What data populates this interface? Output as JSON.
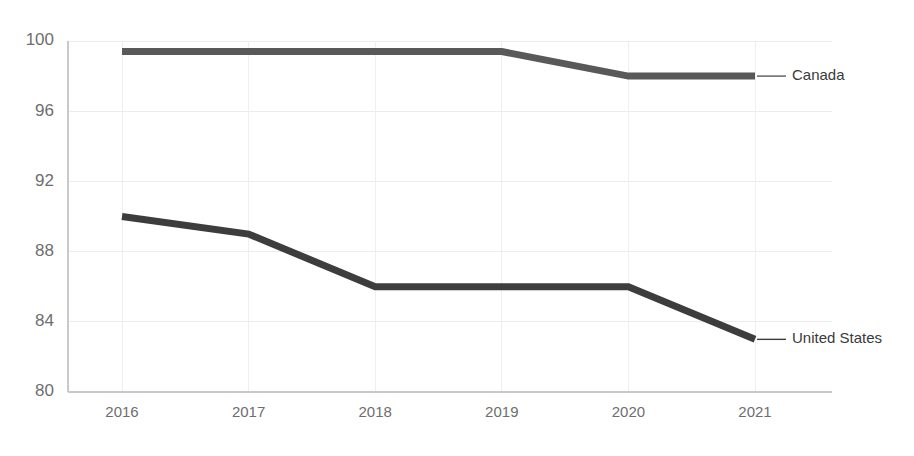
{
  "chart_data": {
    "type": "line",
    "title": "",
    "subtitle": "",
    "xlabel": "",
    "ylabel": "",
    "categories": [
      "2016",
      "2017",
      "2018",
      "2019",
      "2020",
      "2021"
    ],
    "x": [
      2016,
      2017,
      2018,
      2019,
      2020,
      2021
    ],
    "series": [
      {
        "name": "Canada",
        "color": "#595959",
        "values": [
          99.4,
          99.4,
          99.4,
          99.4,
          98.0,
          98.0
        ]
      },
      {
        "name": "United States",
        "color": "#3d3d3d",
        "values": [
          90.0,
          89.0,
          86.0,
          86.0,
          86.0,
          83.0
        ]
      }
    ],
    "ylim": [
      80,
      100
    ],
    "yticks": [
      100,
      96,
      92,
      88,
      84,
      80
    ],
    "ytick_labels": [
      "100",
      "96",
      "92",
      "88",
      "84",
      "80"
    ],
    "xtick_labels": [
      "2016",
      "2017",
      "2018",
      "2019",
      "2020",
      "2021"
    ],
    "grid": true,
    "grid_color": "#ececec",
    "legend_position": "right-inline",
    "axis_color": "#c9c9c9",
    "tick_label_color": "#6e6e6e",
    "background": "#ffffff"
  },
  "axes": {
    "y_ticks": [
      {
        "label": "100",
        "value": 100
      },
      {
        "label": "96",
        "value": 96
      },
      {
        "label": "92",
        "value": 92
      },
      {
        "label": "88",
        "value": 88
      },
      {
        "label": "84",
        "value": 84
      },
      {
        "label": "80",
        "value": 80
      }
    ],
    "x_ticks": [
      {
        "label": "2016",
        "value": 2016
      },
      {
        "label": "2017",
        "value": 2017
      },
      {
        "label": "2018",
        "value": 2018
      },
      {
        "label": "2019",
        "value": 2019
      },
      {
        "label": "2020",
        "value": 2020
      },
      {
        "label": "2021",
        "value": 2021
      }
    ]
  },
  "legend": {
    "entries": [
      {
        "label": "Canada",
        "color": "#595959"
      },
      {
        "label": "United States",
        "color": "#3d3d3d"
      }
    ]
  }
}
